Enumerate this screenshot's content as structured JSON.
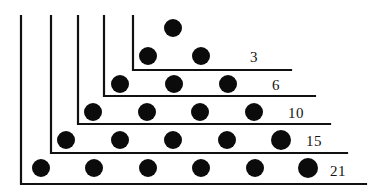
{
  "figure": {
    "name": "triangular-numbers-gnomon-diagram",
    "width": 380,
    "height": 193,
    "background_color": "#ffffff",
    "ink_color": "#111111",
    "dot_color": "#0b0b0b"
  },
  "chart_data": {
    "type": "scatter",
    "title": "",
    "xlabel": "",
    "ylabel": "",
    "categories": [
      "3",
      "6",
      "10",
      "15",
      "21"
    ],
    "values": [
      3,
      6,
      10,
      15,
      21
    ],
    "grid": false,
    "legend": false,
    "rows": [
      {
        "label": "3",
        "dot_count_in_row": 1,
        "cumulative_total": 3,
        "dots": [
          {
            "x": 173,
            "y": 28,
            "r": 9
          }
        ]
      },
      {
        "label": "6",
        "dot_count_in_row": 2,
        "cumulative_total": 6,
        "dots": [
          {
            "x": 148,
            "y": 56,
            "r": 9
          },
          {
            "x": 201,
            "y": 56,
            "r": 9
          }
        ]
      },
      {
        "label": "10",
        "dot_count_in_row": 3,
        "cumulative_total": 10,
        "dots": [
          {
            "x": 120,
            "y": 84,
            "r": 9
          },
          {
            "x": 174,
            "y": 84,
            "r": 9
          },
          {
            "x": 228,
            "y": 84,
            "r": 9
          }
        ]
      },
      {
        "label": "15",
        "dot_count_in_row": 4,
        "cumulative_total": 15,
        "dots": [
          {
            "x": 93,
            "y": 112,
            "r": 9
          },
          {
            "x": 147,
            "y": 112,
            "r": 9
          },
          {
            "x": 200,
            "y": 112,
            "r": 9
          },
          {
            "x": 254,
            "y": 112,
            "r": 9
          }
        ]
      },
      {
        "label": "21",
        "dot_count_in_row": 5,
        "cumulative_total": 21,
        "dots": [
          {
            "x": 66,
            "y": 140,
            "r": 9
          },
          {
            "x": 120,
            "y": 140,
            "r": 9
          },
          {
            "x": 173,
            "y": 140,
            "r": 9
          },
          {
            "x": 227,
            "y": 140,
            "r": 9
          },
          {
            "x": 281,
            "y": 140,
            "r": 10
          }
        ]
      },
      {
        "label": "",
        "dot_count_in_row": 6,
        "cumulative_total": 21,
        "dots": [
          {
            "x": 41,
            "y": 168,
            "r": 9
          },
          {
            "x": 94,
            "y": 168,
            "r": 9
          },
          {
            "x": 148,
            "y": 168,
            "r": 9
          },
          {
            "x": 201,
            "y": 168,
            "r": 9
          },
          {
            "x": 255,
            "y": 168,
            "r": 9
          },
          {
            "x": 308,
            "y": 168,
            "r": 10
          }
        ]
      }
    ],
    "gnomons": [
      {
        "label": "3",
        "corner_x": 133,
        "corner_y": 70,
        "top_y": 16,
        "right_x": 291
      },
      {
        "label": "6",
        "corner_x": 104,
        "corner_y": 96,
        "top_y": 16,
        "right_x": 315
      },
      {
        "label": "10",
        "corner_x": 78,
        "corner_y": 124,
        "top_y": 16,
        "right_x": 330
      },
      {
        "label": "15",
        "corner_x": 51,
        "corner_y": 153,
        "top_y": 16,
        "right_x": 347
      },
      {
        "label": "21",
        "corner_x": 21,
        "corner_y": 184,
        "top_y": 16,
        "right_x": 366
      }
    ],
    "labels": [
      {
        "text": "3",
        "x": 250,
        "y": 62
      },
      {
        "text": "6",
        "x": 272,
        "y": 90
      },
      {
        "text": "10",
        "x": 288,
        "y": 118
      },
      {
        "text": "15",
        "x": 306,
        "y": 146
      },
      {
        "text": "21",
        "x": 330,
        "y": 176
      }
    ]
  }
}
